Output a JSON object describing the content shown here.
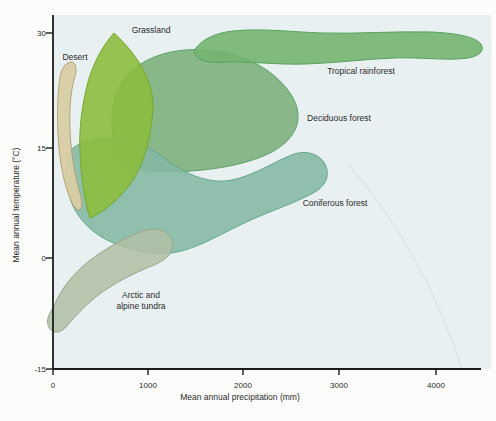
{
  "chart_data": {
    "type": "area",
    "title": "",
    "xlabel": "Mean annual precipitation (mm)",
    "ylabel": "Mean annual temperature (°C)",
    "xlim": [
      0,
      4600
    ],
    "ylim": [
      -15,
      33
    ],
    "x_tick_values": [
      0,
      1000,
      2000,
      3000,
      4000
    ],
    "y_tick_values": [
      -15,
      0,
      15,
      30
    ],
    "grid": false,
    "legend_position": "labels-inline",
    "series": [
      {
        "name": "Desert",
        "precip_mm": [
          50,
          300
        ],
        "temp_c": [
          6,
          27
        ]
      },
      {
        "name": "Grassland",
        "precip_mm": [
          270,
          1070
        ],
        "temp_c": [
          5,
          30
        ]
      },
      {
        "name": "Tropical rainforest",
        "precip_mm": [
          1500,
          4500
        ],
        "temp_c": [
          25,
          30
        ]
      },
      {
        "name": "Deciduous forest",
        "precip_mm": [
          600,
          2550
        ],
        "temp_c": [
          10,
          28
        ]
      },
      {
        "name": "Coniferous forest",
        "precip_mm": [
          150,
          2850
        ],
        "temp_c": [
          0,
          16
        ]
      },
      {
        "name": "Arctic and alpine tundra",
        "precip_mm": [
          0,
          1250
        ],
        "temp_c": [
          -10,
          4
        ]
      }
    ]
  },
  "render": {
    "canvas": {
      "w": 496,
      "h": 421,
      "page_bg": "#fcfcfa"
    },
    "plot": {
      "left": 53,
      "top": 15,
      "bottom": 369,
      "right": 491,
      "axis_right": 481,
      "bg": "#e9f0f2",
      "axis_color": "#1c1c1c"
    },
    "fonts": {
      "tick_size": 8,
      "label_size": 8.5,
      "title_size": 8.5
    },
    "watermark_arc": {
      "d": "M 348,164 Q 424,252 462,369",
      "stroke": "#d6e1dd"
    },
    "x_axis": {
      "title": {
        "text": "Mean annual precipitation (mm)",
        "x": 240,
        "y": 400
      },
      "tick_label_y": 388,
      "tick_len": 6,
      "ticks": [
        {
          "label": "0",
          "px": 53
        },
        {
          "label": "1000",
          "px": 148
        },
        {
          "label": "2000",
          "px": 243
        },
        {
          "label": "3000",
          "px": 339
        },
        {
          "label": "4000",
          "px": 436
        }
      ]
    },
    "y_axis": {
      "title": {
        "text": "Mean annual temperature (°C)",
        "x": 19,
        "y": 205
      },
      "tick_label_x": 46,
      "tick_len": 7,
      "ticks": [
        {
          "label": "30",
          "px": 33
        },
        {
          "label": "15",
          "px": 148
        },
        {
          "label": "0",
          "px": 258
        },
        {
          "label": "-15",
          "px": 369
        }
      ]
    },
    "biomes": [
      {
        "id": "deciduous-forest",
        "fill": "#7db07e",
        "stroke": "#5da268",
        "opacity": 0.9,
        "path": "M 112,122 C 112,96 121,76 139,65 C 157,53 181,48 206,50 C 233,52 256,61 272,74 C 287,86 297,100 298,114 C 299,129 290,142 272,152 C 251,163 221,169 191,171 C 164,173 139,172 126,164 C 115,157 112,141 112,122 Z",
        "label": {
          "lines": [
            "Deciduous forest"
          ],
          "x": 339,
          "y": 121,
          "anchor": "middle"
        }
      },
      {
        "id": "tropical-rainforest",
        "fill": "#74b470",
        "stroke": "#55a35c",
        "opacity": 0.9,
        "path": "M 196,48 C 203,39 215,33 233,31 C 262,28 292,32 322,33 C 357,34 396,31 431,32 C 456,33 476,37 481,44 C 485,51 479,56 468,58 C 449,61 421,57 394,58 C 365,59 336,63 306,64 C 276,65 247,61 226,62 C 213,63 202,62 197,57 C 194,54 193,52 196,48 Z",
        "label": {
          "lines": [
            "Tropical rainforest"
          ],
          "x": 361,
          "y": 74,
          "anchor": "middle"
        }
      },
      {
        "id": "coniferous-forest",
        "fill": "#83b8a3",
        "stroke": "#63a78c",
        "opacity": 0.88,
        "path": "M 70,151 C 79,141 96,137 116,139 C 136,141 151,148 164,158 C 181,171 197,179 216,181 C 241,183 266,166 289,156 C 304,149 319,153 325,164 C 330,174 327,185 315,192 C 294,204 263,213 234,228 C 212,239 196,248 177,252 C 154,257 129,251 107,240 C 87,230 71,211 68,189 C 66,174 66,158 70,151 Z",
        "label": {
          "lines": [
            "Coniferous forest"
          ],
          "x": 335,
          "y": 206,
          "anchor": "middle"
        }
      },
      {
        "id": "grassland",
        "fill": "#8cbd3e",
        "stroke": "#74a82c",
        "opacity": 0.9,
        "path": "M 114,33 C 103,45 91,66 86,90 C 81,112 79,132 80,152 C 81,176 84,200 90,218 C 104,212 121,198 133,180 C 145,162 151,135 153,109 C 154,83 139,56 114,33 Z",
        "label": {
          "lines": [
            "Grassland"
          ],
          "x": 151,
          "y": 33,
          "anchor": "middle"
        }
      },
      {
        "id": "arctic-alpine-tundra",
        "fill": "#b0bfa6",
        "stroke": "#97a68d",
        "opacity": 0.85,
        "path": "M 55,304 C 61,289 73,274 89,261 C 106,248 126,237 143,231 C 157,226 169,231 172,241 C 175,251 168,259 154,265 C 134,273 114,283 97,296 C 83,307 73,319 66,327 C 59,335 50,333 48,325 C 46,317 51,312 55,304 Z",
        "label": {
          "lines": [
            "Arctic and",
            "alpine tundra"
          ],
          "x": 141,
          "y": 298,
          "anchor": "middle"
        }
      },
      {
        "id": "desert",
        "fill": "#d8cda5",
        "stroke": "#b3a276",
        "opacity": 0.95,
        "path": "M 68,63 C 63,65 60,73 59,85 C 57,103 57,125 59,148 C 61,170 66,190 72,203 C 75,209 79,212 81,208 C 83,204 81,197 79,190 C 74,172 71,152 70,130 C 69,108 71,89 75,76 C 77,69 76,63 72,62 C 71,62 69,62 68,63 Z",
        "label": {
          "lines": [
            "Desert"
          ],
          "x": 75,
          "y": 60,
          "anchor": "middle"
        }
      }
    ]
  }
}
